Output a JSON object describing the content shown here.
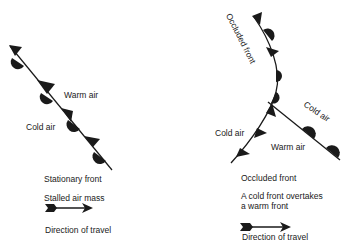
{
  "stationary": {
    "warm_air_label": "Warm air",
    "cold_air_label": "Cold air",
    "title": "Stationary front",
    "description": "Stalled air mass",
    "arrow_caption": "Direction of travel"
  },
  "occluded": {
    "curve_label": "Occluded front",
    "cold_air_right_label": "Cold air",
    "cold_air_left_label": "Cold air",
    "warm_air_label": "Warm air",
    "title": "Occluded front",
    "description_line1": "A cold front overtakes",
    "description_line2": "a warm front",
    "arrow_caption": "Direction of travel"
  },
  "colors": {
    "ink": "#1a1a1a",
    "background": "#ffffff"
  }
}
